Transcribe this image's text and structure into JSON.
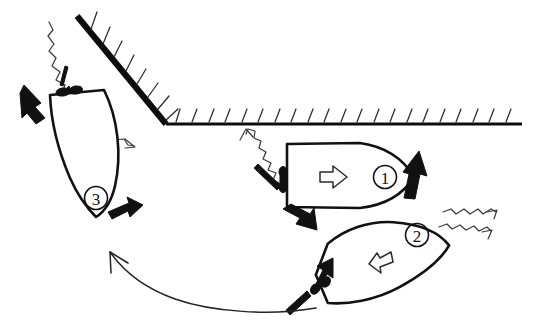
{
  "diagram": {
    "style": "hand-drawn line diagram",
    "background_color": "#ffffff",
    "ink_color": "#111111",
    "width": 540,
    "height": 335
  },
  "shoreline": {
    "diagonal_quay": {
      "name": "diagonal-quay",
      "hatch_count": 9,
      "hatch_side": "upper-right",
      "stroke_weight": "thick"
    },
    "horizontal_quay": {
      "name": "horizontal-quay",
      "hatch_count": 21,
      "hatch_side": "above",
      "stroke_weight": "medium"
    }
  },
  "vessels": [
    {
      "id": "vessel-1",
      "label": "1",
      "heading": "east",
      "interior_arrow": "arrow-right-outline",
      "interior_arrow_glyph": "⇨",
      "bow_thrust": "up-right",
      "stern_thrust": "down-left",
      "mooring": "stern line to port",
      "environment_arrow": "up-left"
    },
    {
      "id": "vessel-2",
      "label": "2",
      "heading": "north-east",
      "interior_arrow": "arrow-left-outline",
      "interior_arrow_glyph": "⇦",
      "stern_thrust": "up-left",
      "mooring": "stern line to port quarter",
      "environment_arrows": 2,
      "environment_direction": "up-right"
    },
    {
      "id": "vessel-3",
      "label": "3",
      "heading": "south-south-east",
      "interior_arrow": "none",
      "stern_thrust": "up-left",
      "bow_thrust": "right",
      "mooring": "bow line with double cleat",
      "environment_arrow": "down-right"
    }
  ],
  "trajectory": {
    "name": "maneuver-path",
    "description": "curved path from vessel 2 stern sweeping left and up",
    "arrowhead": "upper-left",
    "style": "thin curved open arrow"
  },
  "legend": {
    "thrust_arrow": "solid black tug or thruster force",
    "outline_arrow": "vessel intended direction",
    "squiggly_arrow": "wind or current",
    "hatched_line": "quay / shoreline"
  }
}
